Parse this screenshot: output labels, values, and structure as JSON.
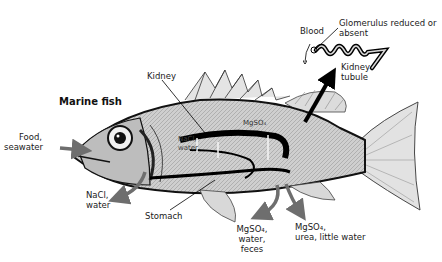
{
  "title": "Marine fish",
  "colors": {
    "body": "#c8c8c8",
    "outline": "#111111",
    "arrow_gray": "#6e6e6e",
    "arrow_black": "#000000",
    "background": "#ffffff"
  },
  "labels": {
    "kidney": "Kidney",
    "mgso4_inside": "MgSO₄",
    "nacl_water_inside_1": "NaCl,",
    "nacl_water_inside_2": "water",
    "food_1": "Food,",
    "food_2": "seawater",
    "nacl_out_1": "NaCl,",
    "nacl_out_2": "water",
    "stomach": "Stomach",
    "feces_1": "MgSO₄,",
    "feces_2": "water,",
    "feces_3": "feces",
    "urine_1": "MgSO₄,",
    "urine_2": "urea, little water",
    "blood": "Blood",
    "glomerulus_1": "Glomerulus reduced or",
    "glomerulus_2": "absent",
    "tubule_1": "Kidney",
    "tubule_2": "tubule"
  },
  "arrows": [
    {
      "name": "food-seawater-in",
      "direction": "into mouth",
      "color": "gray"
    },
    {
      "name": "nacl-water-out-gills",
      "direction": "out from gills",
      "color": "gray"
    },
    {
      "name": "feces-out",
      "direction": "out from anus",
      "color": "gray"
    },
    {
      "name": "urine-out",
      "direction": "out from urinary pore",
      "color": "gray"
    },
    {
      "name": "kidney-to-inset",
      "direction": "kidney to tubule inset",
      "color": "black"
    },
    {
      "name": "blood-flow",
      "direction": "from glomerulus downward",
      "color": "black"
    }
  ]
}
